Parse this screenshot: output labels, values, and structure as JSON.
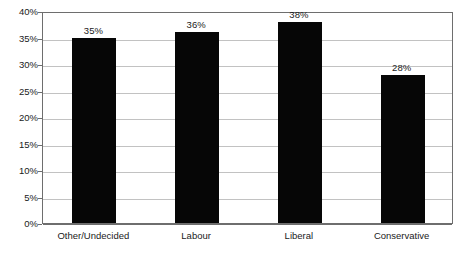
{
  "chart_data": {
    "type": "bar",
    "title": "",
    "xlabel": "",
    "ylabel": "",
    "categories": [
      "Other/Undecided",
      "Labour",
      "Liberal",
      "Conservative"
    ],
    "values": [
      35,
      36,
      38,
      28
    ],
    "data_labels": [
      "35%",
      "36%",
      "38%",
      "28%"
    ],
    "ylim": [
      0,
      40
    ],
    "ytick_values": [
      0,
      5,
      10,
      15,
      20,
      25,
      30,
      35,
      40
    ],
    "ytick_labels": [
      "0%",
      "5%",
      "10%",
      "15%",
      "20%",
      "25%",
      "30%",
      "35%",
      "40%"
    ],
    "grid": true,
    "legend": false,
    "bar_color": "#060606",
    "grid_color": "#c2c2c2",
    "axis_color": "#6e6e6e",
    "background_color": "#ffffff"
  }
}
